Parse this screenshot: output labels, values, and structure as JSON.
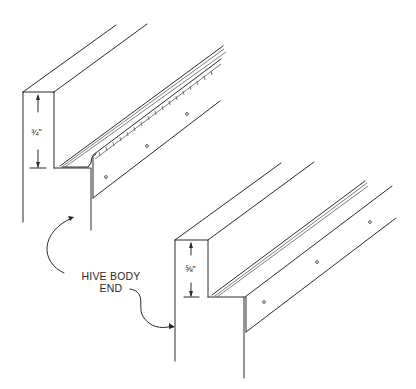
{
  "figure": {
    "type": "technical-illustration"
  },
  "labels": {
    "dimension_top": "¾\"",
    "dimension_bottom": "⅝\"",
    "callout_line1": "HIVE BODY",
    "callout_line2": "END"
  },
  "colors": {
    "background": "#ffffff",
    "ink": "#2a2a2a"
  }
}
